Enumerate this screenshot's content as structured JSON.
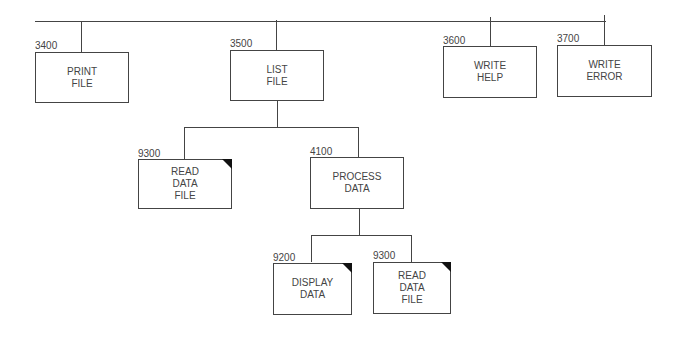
{
  "diagram": {
    "type": "structure-chart",
    "modules": [
      {
        "id": "print-file",
        "number": "3400",
        "lines": [
          "PRINT",
          "FILE"
        ],
        "library": false
      },
      {
        "id": "list-file",
        "number": "3500",
        "lines": [
          "LIST",
          "FILE"
        ],
        "library": false
      },
      {
        "id": "write-help",
        "number": "3600",
        "lines": [
          "WRITE",
          "HELP"
        ],
        "library": false
      },
      {
        "id": "write-error",
        "number": "3700",
        "lines": [
          "WRITE",
          "ERROR"
        ],
        "library": false
      },
      {
        "id": "read-data-file-1",
        "number": "9300",
        "lines": [
          "READ",
          "DATA",
          "FILE"
        ],
        "library": true
      },
      {
        "id": "process-data",
        "number": "4100",
        "lines": [
          "PROCESS",
          "DATA"
        ],
        "library": false
      },
      {
        "id": "display-data",
        "number": "9200",
        "lines": [
          "DISPLAY",
          "DATA"
        ],
        "library": true
      },
      {
        "id": "read-data-file-2",
        "number": "9300",
        "lines": [
          "READ",
          "DATA",
          "FILE"
        ],
        "library": true
      }
    ],
    "connections": [
      {
        "from": "(parent)",
        "to": "print-file"
      },
      {
        "from": "(parent)",
        "to": "list-file"
      },
      {
        "from": "(parent)",
        "to": "write-help"
      },
      {
        "from": "(parent)",
        "to": "write-error"
      },
      {
        "from": "list-file",
        "to": "read-data-file-1"
      },
      {
        "from": "list-file",
        "to": "process-data"
      },
      {
        "from": "process-data",
        "to": "display-data"
      },
      {
        "from": "process-data",
        "to": "read-data-file-2"
      }
    ]
  }
}
